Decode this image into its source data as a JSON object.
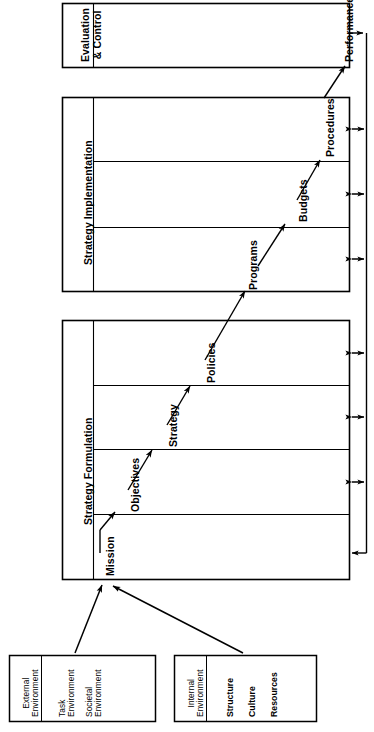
{
  "diagram": {
    "orientation": "rotated-90-ccw",
    "ink_color": "#000000",
    "paper_color": "#ffffff"
  },
  "stages": [
    {
      "id": "evaluation-control",
      "title": "Evaluation\n& Control",
      "title_line1": "Evaluation",
      "title_line2": "& Control",
      "elements": [
        {
          "id": "performance",
          "label": "Performance"
        }
      ]
    },
    {
      "id": "strategy-implementation",
      "title": "Strategy Implementation",
      "elements": [
        {
          "id": "programs",
          "label": "Programs"
        },
        {
          "id": "budgets",
          "label": "Budgets"
        },
        {
          "id": "procedures",
          "label": "Procedures"
        }
      ]
    },
    {
      "id": "strategy-formulation",
      "title": "Strategy Formulation",
      "elements": [
        {
          "id": "mission",
          "label": "Mission"
        },
        {
          "id": "objectives",
          "label": "Objectives"
        },
        {
          "id": "strategy",
          "label": "Strategy"
        },
        {
          "id": "policies",
          "label": "Policies"
        }
      ]
    }
  ],
  "environment_boxes": [
    {
      "id": "external-environment",
      "header_line1": "External",
      "header_line2": "Environment",
      "items": [
        {
          "line1": "Task",
          "line2": "Environment"
        },
        {
          "line1": "Societal",
          "line2": "Environment"
        }
      ]
    },
    {
      "id": "internal-environment",
      "header_line1": "Internal",
      "header_line2": "Environment",
      "items": [
        {
          "line1": "Structure",
          "line2": ""
        },
        {
          "line1": "Culture",
          "line2": ""
        },
        {
          "line1": "Resources",
          "line2": ""
        }
      ]
    }
  ],
  "connectors": {
    "feedback_loop_label": "",
    "flow_arrows": [
      {
        "from": "mission",
        "to": "objectives"
      },
      {
        "from": "objectives",
        "to": "strategy"
      },
      {
        "from": "strategy",
        "to": "policies"
      },
      {
        "from": "policies",
        "to": "programs"
      },
      {
        "from": "programs",
        "to": "budgets"
      },
      {
        "from": "budgets",
        "to": "procedures"
      },
      {
        "from": "procedures",
        "to": "performance"
      }
    ],
    "input_arrows": [
      {
        "from": "external-environment",
        "to": "strategy-formulation"
      },
      {
        "from": "internal-environment",
        "to": "strategy-formulation"
      }
    ],
    "feedback_double_arrow_count": 6,
    "feedback_return_arrow": {
      "from": "performance",
      "to": "strategy-formulation"
    }
  }
}
